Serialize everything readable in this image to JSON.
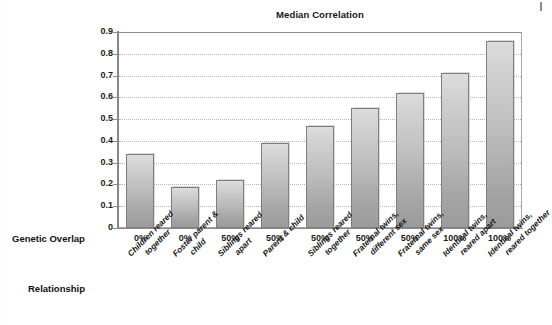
{
  "chart_data": {
    "type": "bar",
    "title": "Median Correlation",
    "xlabel": "Relationship",
    "ylabel": "",
    "ylim": [
      0,
      0.9
    ],
    "grid": true,
    "legend": false,
    "yticks": [
      "0.9",
      "0.8",
      "0.7",
      "0.6",
      "0.5",
      "0.4",
      "0.3",
      "0.2",
      "0.1",
      "0"
    ],
    "ytick_values": [
      0.9,
      0.8,
      0.7,
      0.6,
      0.5,
      0.4,
      0.3,
      0.2,
      0.1,
      0
    ],
    "categories": [
      "Children reared together",
      "Foster parent & child",
      "Siblings reared apart",
      "Parent & child",
      "Siblings reared together",
      "Fraternal twins, different sex",
      "Fraternal twins, same sex",
      "Identical twins, reared apart",
      "Identical twins, reared together"
    ],
    "values": [
      0.34,
      0.19,
      0.22,
      0.39,
      0.47,
      0.55,
      0.62,
      0.71,
      0.86
    ],
    "secondary_axis_label": "Genetic Overlap",
    "secondary_axis_values": [
      "0%",
      "0%",
      "50%",
      "50%",
      "50%",
      "50%",
      "50%",
      "100%",
      "100%"
    ]
  },
  "axes": {
    "row_header_overlap": "Genetic Overlap",
    "row_header_relationship": "Relationship"
  },
  "category_lines": [
    [
      "Children reared",
      "together"
    ],
    [
      "Foster parent &",
      "child"
    ],
    [
      "Siblings reared",
      "apart"
    ],
    [
      "Parent & child",
      ""
    ],
    [
      "Siblings reared",
      "together"
    ],
    [
      "Fraternal twins,",
      "different sex"
    ],
    [
      "Fraternal twins,",
      "same sex"
    ],
    [
      "Identical twins,",
      "reared apart"
    ],
    [
      "Identical twins,",
      "reared together"
    ]
  ],
  "colors": {
    "bar_top": "#dcdcdc",
    "bar_bottom": "#9b9b9b",
    "bar_border": "#7e7e7e",
    "gridline": "#b4b4b4",
    "axis": "#8b8b8b",
    "text": "#161616",
    "background": "#ffffff"
  }
}
